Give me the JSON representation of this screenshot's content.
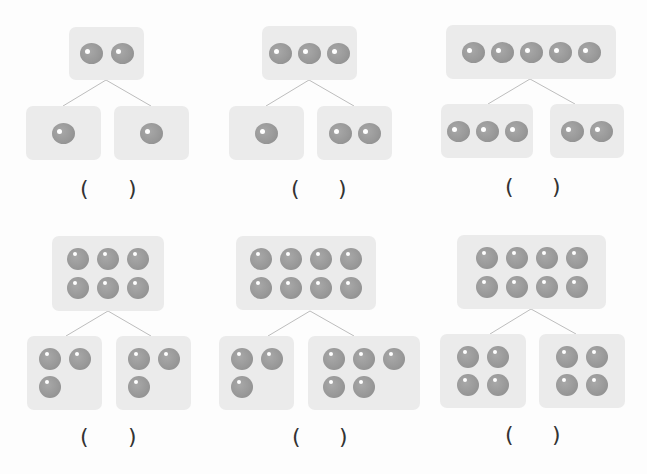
{
  "problems": [
    {
      "top": 2,
      "left": 1,
      "right": 1,
      "answer_blank": "(    )"
    },
    {
      "top": 3,
      "left": 1,
      "right": 2,
      "answer_blank": "(    )"
    },
    {
      "top": 5,
      "left": 3,
      "right": 2,
      "answer_blank": "(    )"
    },
    {
      "top": 6,
      "left": 3,
      "right": 3,
      "answer_blank": "(    )"
    },
    {
      "top": 8,
      "left": 3,
      "right": 5,
      "answer_blank": "(    )"
    },
    {
      "top": 8,
      "left": 4,
      "right": 4,
      "answer_blank": "(    )"
    }
  ],
  "symbols": {
    "open_paren": "(",
    "close_paren": ")"
  },
  "colors": {
    "box": "#ebebeb",
    "dot": "#999999",
    "line": "#bbbbbb",
    "text": "#333333"
  }
}
